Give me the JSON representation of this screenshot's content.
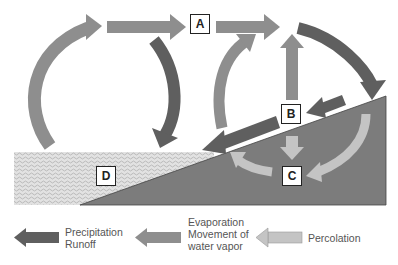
{
  "diagram": {
    "type": "water-cycle",
    "labels": {
      "A": "A",
      "B": "B",
      "C": "C",
      "D": "D"
    },
    "colors": {
      "dark_arrow": "#5f5f5f",
      "medium_arrow": "#8e8e8e",
      "light_arrow": "#c4c4c4",
      "ground": "#7c7c7c",
      "water": "#d8d8d8",
      "box_border": "#222222"
    }
  },
  "legend": {
    "items": [
      {
        "icon": "dark-arrow-icon",
        "line1": "Precipitation",
        "line2": "Runoff",
        "line3": ""
      },
      {
        "icon": "medium-arrow-icon",
        "line1": "Evaporation",
        "line2": "Movement of",
        "line3": "water vapor"
      },
      {
        "icon": "light-arrow-icon",
        "line1": "Percolation",
        "line2": "",
        "line3": ""
      }
    ]
  }
}
